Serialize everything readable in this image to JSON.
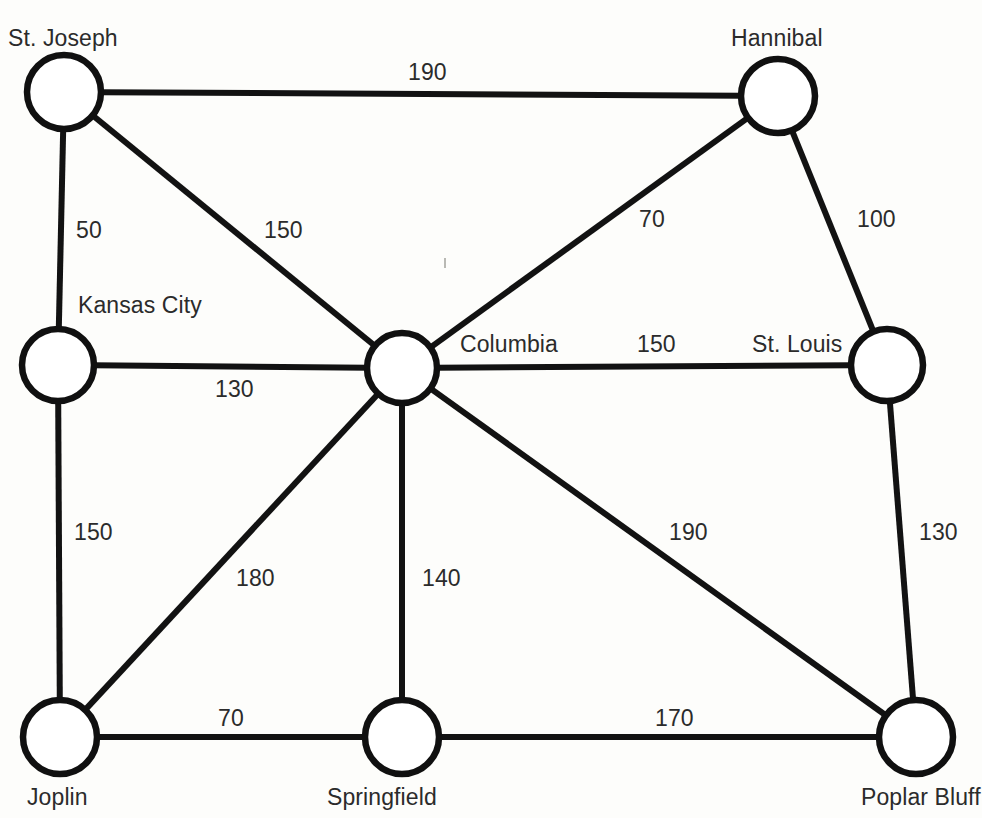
{
  "diagram": {
    "type": "undirected-weighted-graph",
    "background_color": "#fdfdfb",
    "node_fill": "#ffffff",
    "node_stroke": "#101010",
    "edge_color": "#121212",
    "label_color": "#2b2b2b"
  },
  "nodes": [
    {
      "id": "st_joseph",
      "label": "St. Joseph",
      "cx": 64,
      "cy": 92,
      "r": 37,
      "label_x": 8,
      "label_y": 27
    },
    {
      "id": "hannibal",
      "label": "Hannibal",
      "cx": 778,
      "cy": 96,
      "r": 37,
      "label_x": 731,
      "label_y": 27
    },
    {
      "id": "kansas_city",
      "label": "Kansas City",
      "cx": 58,
      "cy": 365,
      "r": 36,
      "label_x": 78,
      "label_y": 294
    },
    {
      "id": "columbia",
      "label": "Columbia",
      "cx": 402,
      "cy": 368,
      "r": 35,
      "label_x": 460,
      "label_y": 333
    },
    {
      "id": "st_louis",
      "label": "St. Louis",
      "cx": 887,
      "cy": 365,
      "r": 36,
      "label_x": 752,
      "label_y": 333
    },
    {
      "id": "joplin",
      "label": "Joplin",
      "cx": 60,
      "cy": 737,
      "r": 37,
      "label_x": 27,
      "label_y": 786
    },
    {
      "id": "springfield",
      "label": "Springfield",
      "cx": 402,
      "cy": 737,
      "r": 37,
      "label_x": 327,
      "label_y": 786
    },
    {
      "id": "poplar_bluff",
      "label": "Poplar Bluff",
      "cx": 916,
      "cy": 737,
      "r": 37,
      "label_x": 861,
      "label_y": 786
    }
  ],
  "edges": [
    {
      "id": "st_joseph-hannibal",
      "from": "st_joseph",
      "to": "hannibal",
      "weight": "190",
      "label_x": 408,
      "label_y": 61
    },
    {
      "id": "st_joseph-kansas_city",
      "from": "st_joseph",
      "to": "kansas_city",
      "weight": "50",
      "label_x": 76,
      "label_y": 219
    },
    {
      "id": "st_joseph-columbia",
      "from": "st_joseph",
      "to": "columbia",
      "weight": "150",
      "label_x": 264,
      "label_y": 219
    },
    {
      "id": "hannibal-columbia",
      "from": "hannibal",
      "to": "columbia",
      "weight": "70",
      "label_x": 639,
      "label_y": 208
    },
    {
      "id": "hannibal-st_louis",
      "from": "hannibal",
      "to": "st_louis",
      "weight": "100",
      "label_x": 857,
      "label_y": 208
    },
    {
      "id": "kansas_city-columbia",
      "from": "kansas_city",
      "to": "columbia",
      "weight": "130",
      "label_x": 215,
      "label_y": 378
    },
    {
      "id": "kansas_city-joplin",
      "from": "kansas_city",
      "to": "joplin",
      "weight": "150",
      "label_x": 74,
      "label_y": 521
    },
    {
      "id": "columbia-st_louis",
      "from": "columbia",
      "to": "st_louis",
      "weight": "150",
      "label_x": 637,
      "label_y": 333
    },
    {
      "id": "columbia-joplin",
      "from": "columbia",
      "to": "joplin",
      "weight": "180",
      "label_x": 236,
      "label_y": 567
    },
    {
      "id": "columbia-springfield",
      "from": "columbia",
      "to": "springfield",
      "weight": "140",
      "label_x": 422,
      "label_y": 567
    },
    {
      "id": "columbia-poplar_bluff",
      "from": "columbia",
      "to": "poplar_bluff",
      "weight": "190",
      "label_x": 669,
      "label_y": 521
    },
    {
      "id": "st_louis-poplar_bluff",
      "from": "st_louis",
      "to": "poplar_bluff",
      "weight": "130",
      "label_x": 919,
      "label_y": 521
    },
    {
      "id": "joplin-springfield",
      "from": "joplin",
      "to": "springfield",
      "weight": "70",
      "label_x": 218,
      "label_y": 707
    },
    {
      "id": "springfield-poplar_bluff",
      "from": "springfield",
      "to": "poplar_bluff",
      "weight": "170",
      "label_x": 655,
      "label_y": 707
    }
  ],
  "specks": [
    {
      "x": 444,
      "y": 258,
      "w": 2,
      "h": 10
    }
  ]
}
